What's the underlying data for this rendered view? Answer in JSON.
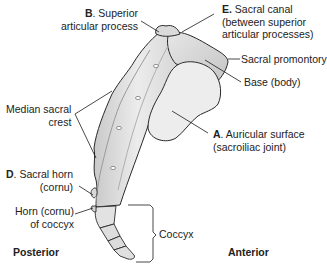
{
  "diagram": {
    "labels": {
      "B": {
        "letter": "B",
        "text": ". Superior",
        "line2": "articular process"
      },
      "E": {
        "letter": "E.",
        "text": " Sacral canal",
        "line2": "(between superior",
        "line3": "articular processes)"
      },
      "promontory": {
        "text": "Sacral promontory"
      },
      "base": {
        "text": "Base (body)"
      },
      "median_crest": {
        "line1": "Median sacral",
        "line2": "crest"
      },
      "A": {
        "letter": "A",
        "text": ". Auricular surface",
        "line2": "(sacroiliac joint)"
      },
      "D": {
        "letter": "D",
        "text": ". Sacral horn",
        "line2": "(cornu)"
      },
      "coccyx_horn": {
        "line1": "Horn (cornu)",
        "line2": "of coccyx"
      },
      "coccyx": {
        "text": "Coccyx"
      }
    },
    "orientation": {
      "posterior": "Posterior",
      "anterior": "Anterior"
    },
    "colors": {
      "bone": "#e4e4e4",
      "bone_shadow": "#b8b8b8",
      "auricular": "#f0f0f0",
      "outline": "#2a2a2a",
      "leader": "#1a1a1a"
    }
  }
}
